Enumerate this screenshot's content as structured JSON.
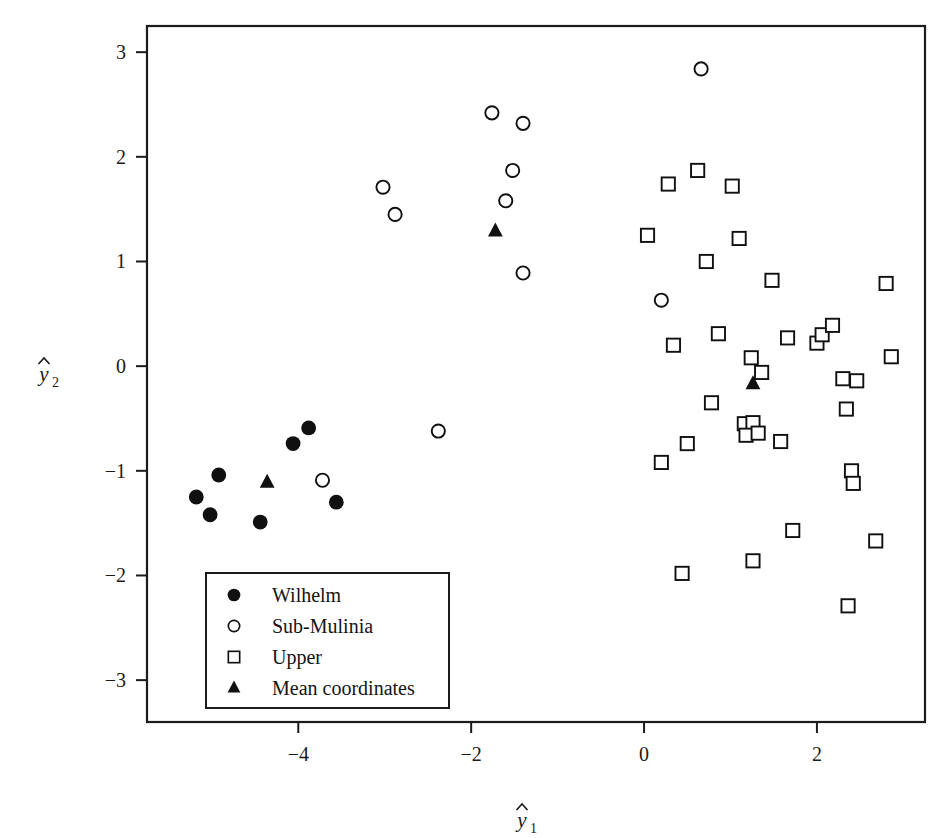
{
  "figure": {
    "background_color": "#ffffff",
    "ink_color": "#1c1c1c",
    "x_axis_title": "y",
    "x_axis_subscript": "1",
    "y_axis_title": "y",
    "y_axis_subscript": "2"
  },
  "legend": {
    "entries": [
      {
        "label": "Wilhelm",
        "marker": "filled-circle"
      },
      {
        "label": "Sub-Mulinia",
        "marker": "open-circle"
      },
      {
        "label": "Upper",
        "marker": "open-square"
      },
      {
        "label": "Mean coordinates",
        "marker": "filled-triangle"
      }
    ]
  },
  "chart_data": {
    "type": "scatter",
    "title": "",
    "xlabel": "y1",
    "ylabel": "y2",
    "xlim": [
      -5.75,
      3.25
    ],
    "ylim": [
      -3.4,
      3.25
    ],
    "xticks": [
      -4,
      -2,
      0,
      2
    ],
    "xtick_labels": [
      "-4",
      "-2",
      "0",
      "2"
    ],
    "yticks": [
      3,
      2,
      1,
      0,
      -1,
      -2,
      -3
    ],
    "ytick_labels": [
      "3",
      "2",
      "1",
      "0",
      "-1",
      "-2",
      "-3"
    ],
    "grid": false,
    "legend_position": "lower-left-inside",
    "series": [
      {
        "name": "Wilhelm",
        "marker": "filled-circle",
        "color": "#101010",
        "points": [
          [
            -5.18,
            -1.25
          ],
          [
            -5.02,
            -1.42
          ],
          [
            -4.92,
            -1.04
          ],
          [
            -4.44,
            -1.49
          ],
          [
            -4.06,
            -0.74
          ],
          [
            -3.88,
            -0.59
          ],
          [
            -3.56,
            -1.3
          ]
        ]
      },
      {
        "name": "Sub-Mulinia",
        "marker": "open-circle",
        "color": "#101010",
        "points": [
          [
            -3.02,
            1.71
          ],
          [
            -2.88,
            1.45
          ],
          [
            -1.76,
            2.42
          ],
          [
            -1.4,
            2.32
          ],
          [
            -1.52,
            1.87
          ],
          [
            -1.6,
            1.58
          ],
          [
            -1.4,
            0.89
          ],
          [
            -3.72,
            -1.09
          ],
          [
            -2.38,
            -0.62
          ],
          [
            0.66,
            2.84
          ],
          [
            0.2,
            0.63
          ]
        ]
      },
      {
        "name": "Upper",
        "marker": "open-square",
        "color": "#101010",
        "points": [
          [
            0.28,
            1.74
          ],
          [
            0.62,
            1.87
          ],
          [
            1.02,
            1.72
          ],
          [
            1.1,
            1.22
          ],
          [
            0.72,
            1.0
          ],
          [
            1.48,
            0.82
          ],
          [
            0.04,
            1.25
          ],
          [
            0.34,
            0.2
          ],
          [
            0.86,
            0.31
          ],
          [
            1.66,
            0.27
          ],
          [
            2.0,
            0.22
          ],
          [
            2.06,
            0.3
          ],
          [
            2.18,
            0.39
          ],
          [
            2.8,
            0.79
          ],
          [
            1.24,
            0.08
          ],
          [
            1.36,
            -0.06
          ],
          [
            2.3,
            -0.12
          ],
          [
            2.46,
            -0.14
          ],
          [
            2.86,
            0.09
          ],
          [
            2.34,
            -0.41
          ],
          [
            0.78,
            -0.35
          ],
          [
            0.5,
            -0.74
          ],
          [
            0.2,
            -0.92
          ],
          [
            1.16,
            -0.55
          ],
          [
            1.26,
            -0.54
          ],
          [
            1.18,
            -0.66
          ],
          [
            1.32,
            -0.64
          ],
          [
            1.58,
            -0.72
          ],
          [
            2.4,
            -1.0
          ],
          [
            2.42,
            -1.12
          ],
          [
            1.72,
            -1.57
          ],
          [
            2.68,
            -1.67
          ],
          [
            0.44,
            -1.98
          ],
          [
            1.26,
            -1.86
          ],
          [
            2.36,
            -2.29
          ]
        ]
      },
      {
        "name": "Mean coordinates",
        "marker": "filled-triangle",
        "color": "#101010",
        "points": [
          [
            -4.36,
            -1.11
          ],
          [
            -1.72,
            1.29
          ],
          [
            1.26,
            -0.17
          ]
        ]
      }
    ]
  }
}
